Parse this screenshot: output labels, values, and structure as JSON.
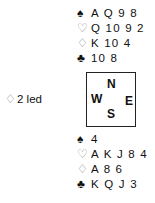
{
  "diagram": {
    "north": {
      "spades": "A Q 9 8",
      "hearts": "Q 10 9 2",
      "diamonds": "K 10 4",
      "clubs": "10 8"
    },
    "south": {
      "spades": "4",
      "hearts": "A K J 8 4",
      "diamonds": "A 8 6",
      "clubs": "K Q J 3"
    },
    "lead": {
      "suit_symbol": "♢",
      "text": "2 led"
    },
    "compass": {
      "n": "N",
      "w": "W",
      "e": "E",
      "s": "S"
    },
    "suit_symbols": {
      "spades": "♠",
      "hearts": "♡",
      "diamonds": "♢",
      "clubs": "♣"
    }
  }
}
